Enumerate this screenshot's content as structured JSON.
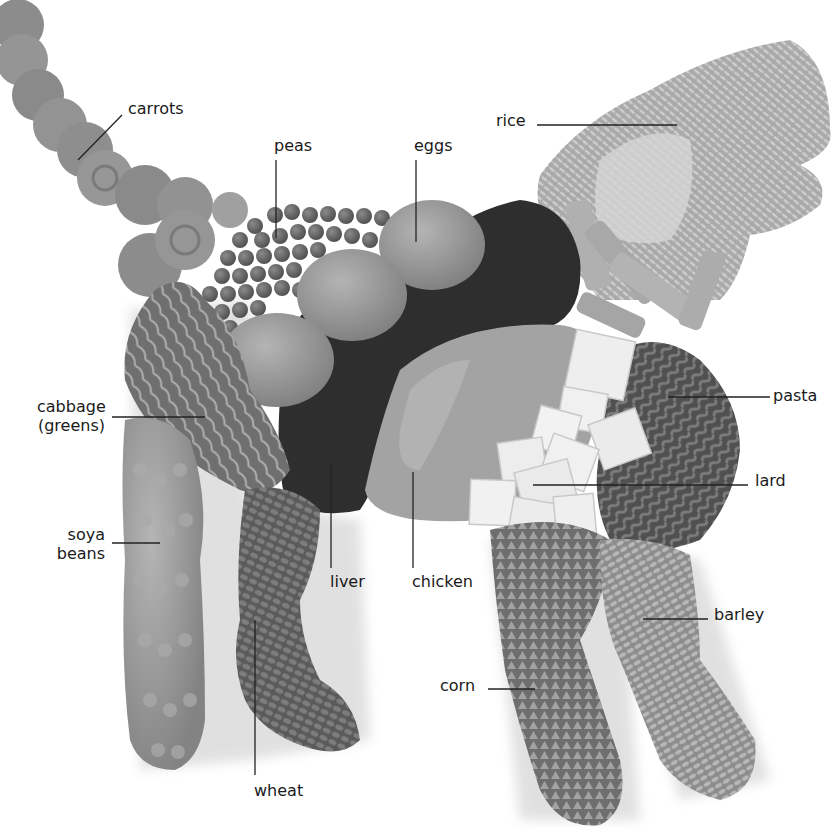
{
  "figure": {
    "palette": {
      "background": "#ffffff",
      "label_text": "#1a1a1a",
      "leader_line": "#222222",
      "carrots": "#8f8f8f",
      "peas": "#6e6e6e",
      "eggs": "#9a9a9a",
      "liver": "#2e2e2e",
      "chicken": "#a3a3a3",
      "rice": "#bdbdbd",
      "pasta": "#a8a8a8",
      "fusilli": "#6b6b6b",
      "lard": "#eeeeee",
      "cabbage": "#8a8a8a",
      "soya": "#9c9c9c",
      "wheat": "#6a6a6a",
      "corn": "#8e8e8e",
      "barley": "#a6a6a6"
    }
  },
  "labels": {
    "carrots": "carrots",
    "peas": "peas",
    "eggs": "eggs",
    "rice": "rice",
    "pasta": "pasta",
    "cabbage_line1": "cabbage",
    "cabbage_line2": "(greens)",
    "lard": "lard",
    "soya_line1": "soya",
    "soya_line2": "beans",
    "liver": "liver",
    "chicken": "chicken",
    "barley": "barley",
    "corn": "corn",
    "wheat": "wheat"
  }
}
